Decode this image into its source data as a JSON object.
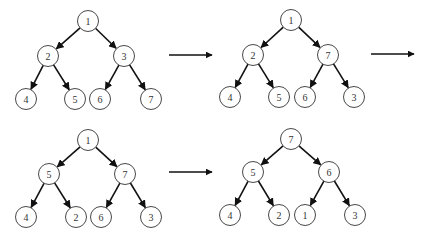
{
  "colors": {
    "node_fill": "#ffffff",
    "node_stroke": "#333333",
    "edge": "#111111",
    "background": "#ffffff"
  },
  "node_radius": 10.5,
  "trees": [
    {
      "name": "step-1",
      "nodes": [
        {
          "id": "r",
          "label": "1",
          "x": 88,
          "y": 21
        },
        {
          "id": "a",
          "label": "2",
          "x": 48,
          "y": 56
        },
        {
          "id": "b",
          "label": "3",
          "x": 124,
          "y": 56
        },
        {
          "id": "c",
          "label": "4",
          "x": 26,
          "y": 99
        },
        {
          "id": "d",
          "label": "5",
          "x": 75,
          "y": 99
        },
        {
          "id": "e",
          "label": "6",
          "x": 100,
          "y": 99
        },
        {
          "id": "f",
          "label": "7",
          "x": 151,
          "y": 99
        }
      ],
      "edges": [
        [
          "r",
          "a"
        ],
        [
          "r",
          "b"
        ],
        [
          "a",
          "c"
        ],
        [
          "a",
          "d"
        ],
        [
          "b",
          "e"
        ],
        [
          "b",
          "f"
        ]
      ]
    },
    {
      "name": "step-2",
      "nodes": [
        {
          "id": "r",
          "label": "1",
          "x": 291,
          "y": 20
        },
        {
          "id": "a",
          "label": "2",
          "x": 253,
          "y": 55
        },
        {
          "id": "b",
          "label": "7",
          "x": 328,
          "y": 55
        },
        {
          "id": "c",
          "label": "4",
          "x": 230,
          "y": 97
        },
        {
          "id": "d",
          "label": "5",
          "x": 279,
          "y": 97
        },
        {
          "id": "e",
          "label": "6",
          "x": 305,
          "y": 97
        },
        {
          "id": "f",
          "label": "3",
          "x": 354,
          "y": 97
        }
      ],
      "edges": [
        [
          "r",
          "a"
        ],
        [
          "r",
          "b"
        ],
        [
          "a",
          "c"
        ],
        [
          "a",
          "d"
        ],
        [
          "b",
          "e"
        ],
        [
          "b",
          "f"
        ]
      ]
    },
    {
      "name": "step-3",
      "nodes": [
        {
          "id": "r",
          "label": "1",
          "x": 88,
          "y": 140
        },
        {
          "id": "a",
          "label": "5",
          "x": 49,
          "y": 174
        },
        {
          "id": "b",
          "label": "7",
          "x": 125,
          "y": 174
        },
        {
          "id": "c",
          "label": "4",
          "x": 26,
          "y": 217
        },
        {
          "id": "d",
          "label": "2",
          "x": 76,
          "y": 217
        },
        {
          "id": "e",
          "label": "6",
          "x": 101,
          "y": 217
        },
        {
          "id": "f",
          "label": "3",
          "x": 151,
          "y": 217
        }
      ],
      "edges": [
        [
          "r",
          "a"
        ],
        [
          "r",
          "b"
        ],
        [
          "a",
          "c"
        ],
        [
          "a",
          "d"
        ],
        [
          "b",
          "e"
        ],
        [
          "b",
          "f"
        ]
      ]
    },
    {
      "name": "step-4",
      "nodes": [
        {
          "id": "r",
          "label": "7",
          "x": 291,
          "y": 139
        },
        {
          "id": "a",
          "label": "5",
          "x": 253,
          "y": 172
        },
        {
          "id": "b",
          "label": "6",
          "x": 329,
          "y": 172
        },
        {
          "id": "c",
          "label": "4",
          "x": 230,
          "y": 215
        },
        {
          "id": "d",
          "label": "2",
          "x": 279,
          "y": 215
        },
        {
          "id": "e",
          "label": "1",
          "x": 305,
          "y": 215
        },
        {
          "id": "f",
          "label": "3",
          "x": 355,
          "y": 215
        }
      ],
      "edges": [
        [
          "r",
          "a"
        ],
        [
          "r",
          "b"
        ],
        [
          "a",
          "c"
        ],
        [
          "a",
          "d"
        ],
        [
          "b",
          "e"
        ],
        [
          "b",
          "f"
        ]
      ]
    }
  ],
  "step_arrows": [
    {
      "x1": 169,
      "y1": 55,
      "x2": 212,
      "y2": 55
    },
    {
      "x1": 371,
      "y1": 54,
      "x2": 414,
      "y2": 54
    },
    {
      "x1": 169,
      "y1": 172,
      "x2": 212,
      "y2": 172
    }
  ]
}
